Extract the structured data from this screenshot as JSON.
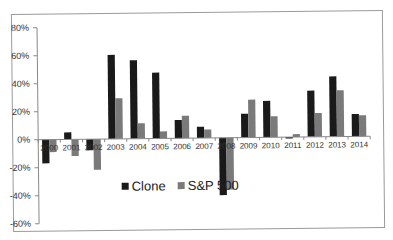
{
  "chart_data": {
    "type": "bar",
    "title": "",
    "xlabel": "",
    "ylabel": "",
    "categories": [
      "2000",
      "2001",
      "2002",
      "2003",
      "2004",
      "2005",
      "2006",
      "2007",
      "2008",
      "2009",
      "2010",
      "2011",
      "2012",
      "2013",
      "2014"
    ],
    "series": [
      {
        "name": "Clone",
        "color": "#1a1a1a",
        "values": [
          -17,
          5,
          -8,
          60,
          56,
          47,
          13,
          8,
          -41,
          17,
          26,
          -1,
          33,
          43,
          16
        ]
      },
      {
        "name": "S&P 500",
        "color": "#7a7a7a",
        "values": [
          -9,
          -12,
          -22,
          29,
          11,
          5,
          16,
          6,
          -37,
          27,
          15,
          2,
          17,
          33,
          15
        ]
      }
    ],
    "ylim": [
      -60,
      80
    ],
    "yticks": [
      80,
      60,
      40,
      20,
      0,
      -20,
      -40,
      -60
    ],
    "ytick_labels": [
      "80%",
      "60%",
      "40%",
      "20%",
      "0%",
      "-20%",
      "-40%",
      "-60%"
    ],
    "grid": false,
    "legend_position": "inside-bottom-center"
  }
}
